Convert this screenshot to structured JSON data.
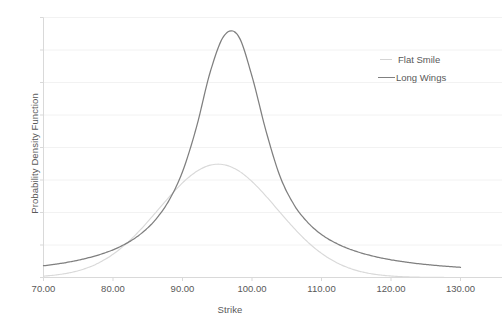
{
  "chart_data": {
    "type": "line",
    "title": "",
    "xlabel": "Strike",
    "ylabel": "Probability Density Function",
    "xlim": [
      70,
      130
    ],
    "ylim": [
      0,
      0.0575
    ],
    "xticks": [
      "70.00",
      "80.00",
      "90.00",
      "100.00",
      "110.00",
      "120.00",
      "130.00"
    ],
    "xtick_values": [
      70,
      80,
      90,
      100,
      110,
      120,
      130
    ],
    "yticks": [],
    "grid": "horizontal",
    "gridlines": 8,
    "legend_position": "right",
    "series": [
      {
        "name": "Flat Smile",
        "color": "#d9d9d9",
        "distribution": "normal",
        "mean": 100.0,
        "sigma": 8.6,
        "peak_x": 100.0,
        "peak_y": 0.0324,
        "x": [
          70,
          72,
          74,
          76,
          78,
          80,
          82,
          84,
          86,
          88,
          90,
          92,
          94,
          96,
          98,
          100,
          102,
          104,
          106,
          108,
          110,
          112,
          114,
          116,
          118,
          120,
          122,
          124,
          126,
          128,
          130
        ],
        "values": [
          0.0003,
          0.0006,
          0.00112,
          0.00197,
          0.00327,
          0.00513,
          0.0076,
          0.01064,
          0.0141,
          0.01766,
          0.02092,
          0.02344,
          0.02485,
          0.02493,
          0.02366,
          0.02123,
          0.01802,
          0.01446,
          0.01098,
          0.00787,
          0.00534,
          0.00342,
          0.00207,
          0.00118,
          0.00064,
          0.00033,
          0.00016,
          7e-05,
          3e-05,
          1e-05,
          0.0
        ]
      },
      {
        "name": "Long Wings",
        "color": "#7f7f7f",
        "distribution": "leptokurtic-fat-tails",
        "mean": 100.5,
        "peak_x": 100.5,
        "peak_y": 0.0545,
        "x": [
          70,
          72,
          74,
          76,
          78,
          80,
          82,
          84,
          86,
          88,
          90,
          92,
          94,
          96,
          98,
          100,
          102,
          104,
          106,
          108,
          110,
          112,
          114,
          116,
          118,
          120,
          122,
          124,
          126,
          128,
          130
        ],
        "values": [
          0.0026,
          0.003,
          0.00352,
          0.00418,
          0.00502,
          0.00612,
          0.0076,
          0.00965,
          0.01258,
          0.0169,
          0.0234,
          0.0332,
          0.0455,
          0.0535,
          0.0535,
          0.0445,
          0.0325,
          0.0225,
          0.0162,
          0.0122,
          0.0095,
          0.00765,
          0.0063,
          0.0053,
          0.00452,
          0.00392,
          0.00344,
          0.00305,
          0.00273,
          0.00247,
          0.00225
        ]
      }
    ]
  },
  "axes": {
    "x_title": "Strike",
    "y_title": "Probability Density Function"
  },
  "legend": {
    "items": [
      {
        "label": "Flat Smile"
      },
      {
        "label": "Long Wings"
      }
    ]
  },
  "colors": {
    "background": "#ffffff",
    "grid": "#f2f2f2",
    "axis": "#d9d9d9",
    "text": "#595959",
    "flat_smile": "#d9d9d9",
    "long_wings": "#7f7f7f"
  }
}
